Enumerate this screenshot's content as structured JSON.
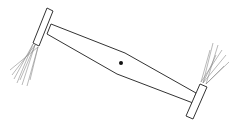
{
  "diagram": {
    "type": "rotating-rod-with-end-brushes",
    "colors": {
      "background": "#ffffff",
      "stroke": "#333333",
      "bristles": "#8a8a8a",
      "pivot": "#111111"
    },
    "rod": {
      "top_edge": [
        [
          51,
          24
        ],
        [
          125,
          53
        ],
        [
          196,
          93
        ]
      ],
      "bottom_edge": [
        [
          47,
          34
        ],
        [
          117,
          74
        ],
        [
          193,
          103
        ]
      ]
    },
    "pivot": {
      "cx": 121,
      "cy": 63,
      "r": 2
    },
    "left_cap": {
      "points": [
        [
          47,
          8
        ],
        [
          53,
          11
        ],
        [
          39,
          46
        ],
        [
          33,
          43
        ]
      ]
    },
    "right_cap": {
      "points": [
        [
          200,
          84
        ],
        [
          207,
          87
        ],
        [
          193,
          119
        ],
        [
          186,
          116
        ]
      ]
    },
    "left_bristles": {
      "origin": [
        [
          35,
          45
        ],
        [
          38,
          47
        ],
        [
          33,
          44
        ]
      ],
      "tips": [
        [
          12,
          75
        ],
        [
          10,
          70
        ],
        [
          17,
          83
        ],
        [
          22,
          85
        ],
        [
          27,
          86
        ],
        [
          14,
          79
        ],
        [
          20,
          80
        ],
        [
          30,
          80
        ]
      ]
    },
    "right_bristles": {
      "origin": [
        [
          203,
          83
        ],
        [
          206,
          84
        ],
        [
          201,
          82
        ]
      ],
      "tips": [
        [
          213,
          43
        ],
        [
          218,
          45
        ],
        [
          222,
          50
        ],
        [
          226,
          55
        ],
        [
          229,
          62
        ],
        [
          210,
          50
        ],
        [
          216,
          55
        ],
        [
          224,
          66
        ]
      ]
    }
  }
}
